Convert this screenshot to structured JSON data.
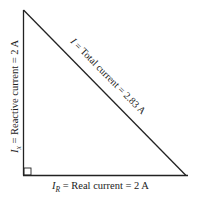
{
  "diagram": {
    "type": "right-triangle-current-phasor",
    "line_color": "#222222",
    "background": "#ffffff",
    "vertices": {
      "top": [
        23,
        10
      ],
      "right_angle": [
        23,
        175
      ],
      "right": [
        186,
        175
      ]
    },
    "vertical_side": {
      "symbol": "I",
      "subscript": "x",
      "text": " = Reactive current = 2 A",
      "value_amps": 2
    },
    "horizontal_side": {
      "symbol": "I",
      "subscript": "R",
      "text": " = Real current = 2 A",
      "value_amps": 2
    },
    "hypotenuse": {
      "symbol": "I",
      "text": " = Total current = 2.83 A",
      "value_amps": 2.83
    },
    "right_angle_marker": true
  }
}
